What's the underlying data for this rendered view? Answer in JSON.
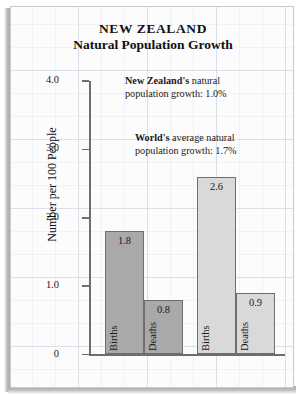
{
  "chart_data": {
    "type": "bar",
    "title": "NEW ZEALAND",
    "subtitle": "Natural Population Growth",
    "xlabel": "",
    "ylabel": "Number per 100 People",
    "ylim": [
      0,
      4.0
    ],
    "yticks": [
      "0",
      "1.0",
      "2.0",
      "3.0",
      "4.0"
    ],
    "ytick_values": [
      0,
      1.0,
      2.0,
      3.0,
      4.0
    ],
    "grid": true,
    "legend": "none",
    "groups": [
      {
        "name": "New Zealand",
        "fill": "#a9a9a9",
        "bars": [
          {
            "category": "Births",
            "value": 1.8,
            "label": "1.8"
          },
          {
            "category": "Deaths",
            "value": 0.8,
            "label": "0.8"
          }
        ]
      },
      {
        "name": "World",
        "fill": "#d9d9d9",
        "bars": [
          {
            "category": "Births",
            "value": 2.6,
            "label": "2.6"
          },
          {
            "category": "Deaths",
            "value": 0.9,
            "label": "0.9"
          }
        ]
      }
    ],
    "annotations": [
      {
        "id": "new-zealand",
        "bold": "New Zealand's",
        "rest": " natural",
        "line2": "population growth:  1.0%"
      },
      {
        "id": "world",
        "bold": "World's",
        "rest": " average natural",
        "line2": "population growth:  1.7%"
      }
    ]
  }
}
